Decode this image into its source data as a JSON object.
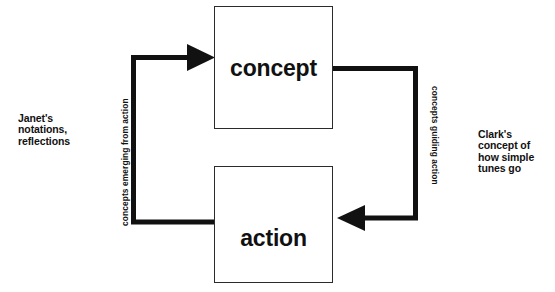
{
  "diagram": {
    "background_color": "#ffffff",
    "stroke_color": "#111111",
    "box_border_color": "#2b2b2b",
    "nodes": [
      {
        "id": "concept",
        "label": "concept"
      },
      {
        "id": "action",
        "label": "action"
      }
    ],
    "edges": [
      {
        "id": "action-to-concept",
        "label": "concepts emerging from action",
        "from": "action",
        "to": "concept",
        "side": "left",
        "text_orientation": "rotated-counterclockwise"
      },
      {
        "id": "concept-to-action",
        "label": "concepts guiding action",
        "from": "concept",
        "to": "action",
        "side": "right",
        "text_orientation": "rotated-clockwise"
      }
    ],
    "annotations": [
      {
        "id": "janet-note",
        "side": "left",
        "text": "Janet's\nnotations,\nreflections"
      },
      {
        "id": "clark-note",
        "side": "right",
        "text": "Clark's\nconcept of\nhow simple\ntunes go"
      }
    ]
  }
}
